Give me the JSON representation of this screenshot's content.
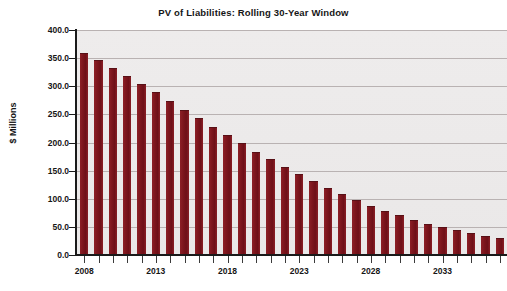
{
  "chart_data": {
    "type": "bar",
    "title": "PV of Liabilities: Rolling 30-Year Window",
    "xlabel": "",
    "ylabel": "$ Millions",
    "ylim": [
      0.0,
      400.0
    ],
    "ytick_step": 50.0,
    "ytick_labels": [
      "0.0",
      "50.0",
      "100.0",
      "150.0",
      "200.0",
      "250.0",
      "300.0",
      "350.0",
      "400.0"
    ],
    "ytick_values": [
      0.0,
      50.0,
      100.0,
      150.0,
      200.0,
      250.0,
      300.0,
      350.0,
      400.0
    ],
    "grid": true,
    "grid_axis": "y",
    "legend": false,
    "legend_position": "none",
    "bar_color": "#7d161d",
    "plot_background": "#eceaea",
    "figure_background": "#ffffff",
    "gridline_color": "#b9b2b2",
    "axis_color": "#1a1a1a",
    "categories": [
      "2008",
      "2009",
      "2010",
      "2011",
      "2012",
      "2013",
      "2014",
      "2015",
      "2016",
      "2017",
      "2018",
      "2019",
      "2020",
      "2021",
      "2022",
      "2023",
      "2024",
      "2025",
      "2026",
      "2027",
      "2028",
      "2029",
      "2030",
      "2031",
      "2032",
      "2033",
      "2034",
      "2035",
      "2036",
      "2037"
    ],
    "xtick_labels": [
      "2008",
      "2013",
      "2018",
      "2023",
      "2028",
      "2033"
    ],
    "xtick_label_indices": [
      0,
      5,
      10,
      15,
      20,
      25
    ],
    "values": [
      359.0,
      346.0,
      332.0,
      318.0,
      304.0,
      289.0,
      273.0,
      258.0,
      243.0,
      228.0,
      213.0,
      199.0,
      184.0,
      170.0,
      156.0,
      144.0,
      131.0,
      119.0,
      108.0,
      97.0,
      88.0,
      79.0,
      71.0,
      63.0,
      55.0,
      49.0,
      44.0,
      39.0,
      34.0,
      30.0
    ]
  }
}
